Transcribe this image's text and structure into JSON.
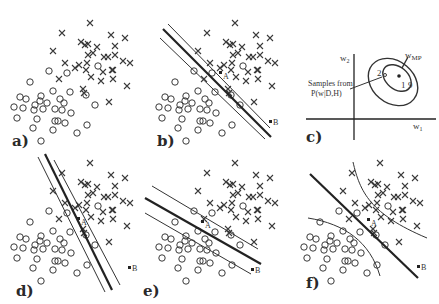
{
  "figure": {
    "panels": [
      {
        "id": "a",
        "label": "a)"
      },
      {
        "id": "b",
        "label": "b)"
      },
      {
        "id": "c",
        "label": "c)"
      },
      {
        "id": "d",
        "label": "d)"
      },
      {
        "id": "e",
        "label": "e)"
      },
      {
        "id": "f",
        "label": "f)"
      }
    ],
    "points": {
      "A": "A",
      "B": "B"
    },
    "panel_c": {
      "x_axis_label": "w",
      "x_axis_sub": "1",
      "y_axis_label": "w",
      "y_axis_sub": "2",
      "wmp_label": "w",
      "wmp_sub": "MP",
      "samples_line1": "Samples from",
      "samples_line2": "P(w|D,H)",
      "sample_1": "1",
      "sample_2": "2"
    },
    "data": {
      "crosses": [
        [
          90,
          23
        ],
        [
          62,
          33
        ],
        [
          111,
          35
        ],
        [
          125,
          38
        ],
        [
          81,
          42
        ],
        [
          85,
          45
        ],
        [
          88,
          44
        ],
        [
          97,
          47
        ],
        [
          53,
          51
        ],
        [
          115,
          46
        ],
        [
          88,
          55
        ],
        [
          93,
          53
        ],
        [
          104,
          57
        ],
        [
          108,
          57
        ],
        [
          115,
          55
        ],
        [
          123,
          61
        ],
        [
          130,
          63
        ],
        [
          65,
          63
        ],
        [
          79,
          65
        ],
        [
          75,
          68
        ],
        [
          87,
          63
        ],
        [
          86,
          70
        ],
        [
          112,
          70
        ],
        [
          59,
          79
        ],
        [
          91,
          77
        ],
        [
          103,
          72
        ],
        [
          113,
          70
        ],
        [
          101,
          81
        ],
        [
          113,
          79
        ],
        [
          83,
          89
        ],
        [
          127,
          86
        ],
        [
          109,
          102
        ],
        [
          84,
          93
        ]
      ],
      "circles": [
        [
          49,
          71
        ],
        [
          67,
          73
        ],
        [
          98,
          66
        ],
        [
          30,
          82
        ],
        [
          53,
          91
        ],
        [
          70,
          92
        ],
        [
          20,
          97
        ],
        [
          26,
          99
        ],
        [
          41,
          96
        ],
        [
          40,
          101
        ],
        [
          47,
          103
        ],
        [
          60,
          99
        ],
        [
          64,
          103
        ],
        [
          86,
          95
        ],
        [
          14,
          107
        ],
        [
          23,
          108
        ],
        [
          35,
          105
        ],
        [
          34,
          110
        ],
        [
          43,
          109
        ],
        [
          55,
          109
        ],
        [
          62,
          110
        ],
        [
          95,
          105
        ],
        [
          71,
          113
        ],
        [
          17,
          118
        ],
        [
          37,
          119
        ],
        [
          55,
          121
        ],
        [
          58,
          121
        ],
        [
          65,
          123
        ],
        [
          87,
          125
        ],
        [
          33,
          128
        ],
        [
          53,
          130
        ],
        [
          77,
          133
        ],
        [
          41,
          141
        ]
      ]
    }
  }
}
